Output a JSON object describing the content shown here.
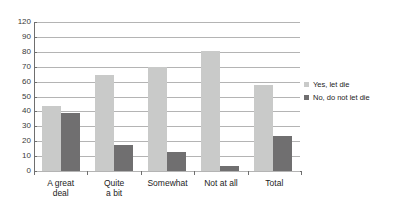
{
  "chart_data": {
    "type": "bar",
    "title": "",
    "xlabel": "",
    "ylabel": "",
    "categories": [
      "A great\ndeal",
      "Quite\na bit",
      "Somewhat",
      "Not at all",
      "Total"
    ],
    "series": [
      {
        "name": "Yes, let die",
        "color": "#c9cac9",
        "values": [
          52,
          77,
          84,
          97,
          69
        ]
      },
      {
        "name": "No, do not let die",
        "color": "#706f70",
        "values": [
          47,
          21,
          15,
          4,
          28
        ]
      }
    ],
    "ylim": [
      0,
      120
    ],
    "ytick_labels": [
      "120",
      "90",
      "80",
      "70",
      "60",
      "50",
      "40",
      "30",
      "20",
      "10",
      "0"
    ],
    "ytick_values": [
      120,
      90,
      80,
      70,
      60,
      50,
      40,
      30,
      20,
      10,
      0
    ],
    "grid": true,
    "legend_position": "right",
    "grid_color": "#b4b4b4",
    "axis_color": "#6f6f6f",
    "background": "#ffffff"
  }
}
